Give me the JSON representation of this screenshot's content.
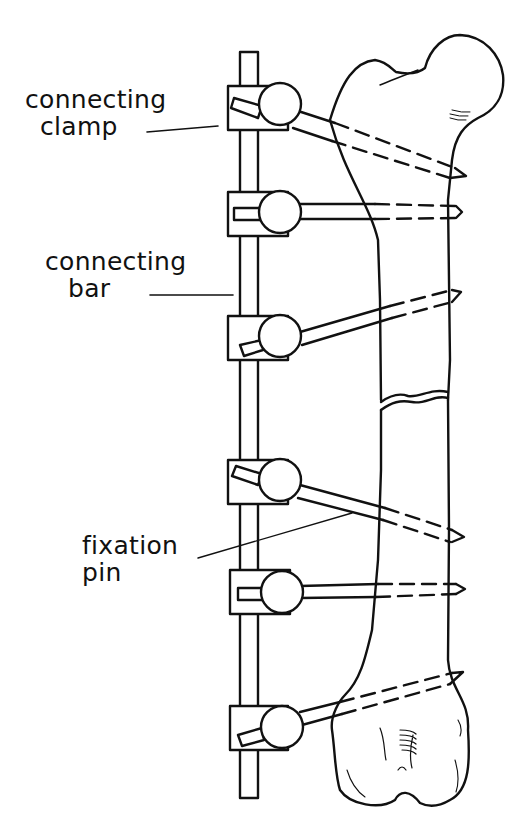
{
  "diagram": {
    "labels": [
      {
        "id": "connecting-clamp",
        "line1": "connecting",
        "line2": "clamp"
      },
      {
        "id": "connecting-bar",
        "line1": "connecting",
        "line2": "bar"
      },
      {
        "id": "fixation-pin",
        "line1": "fixation",
        "line2": "pin"
      }
    ],
    "components": {
      "connecting_bar_count": 1,
      "clamp_count": 6,
      "pin_count": 6,
      "fracture_present": true
    },
    "colors": {
      "ink": "#111111",
      "background": "#ffffff"
    }
  }
}
